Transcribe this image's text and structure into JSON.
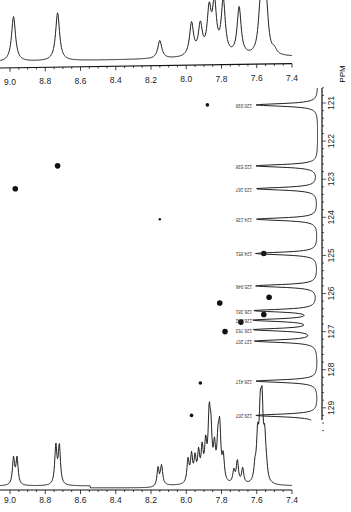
{
  "chart_data": {
    "type": "scatter",
    "title": "",
    "x_axis": {
      "label": "",
      "unit": "ppm (1H)",
      "range": [
        9.0,
        7.4
      ],
      "ticks": [
        "9.0",
        "8.8",
        "8.6",
        "8.4",
        "8.2",
        "8.0",
        "7.8",
        "7.6",
        "7.4"
      ]
    },
    "y_axis": {
      "label": "PPM",
      "unit": "ppm (13C)",
      "range": [
        121,
        129
      ],
      "ticks": [
        "121",
        "122",
        "123",
        "124",
        "125",
        "126",
        "127",
        "128",
        "129"
      ]
    },
    "cross_peaks": [
      {
        "h": 7.88,
        "c": 121.05
      },
      {
        "h": 8.73,
        "c": 122.65
      },
      {
        "h": 8.97,
        "c": 123.25
      },
      {
        "h": 8.15,
        "c": 124.05
      },
      {
        "h": 7.56,
        "c": 124.95
      },
      {
        "h": 7.81,
        "c": 126.25
      },
      {
        "h": 7.53,
        "c": 126.1
      },
      {
        "h": 7.56,
        "c": 126.55
      },
      {
        "h": 7.69,
        "c": 126.75
      },
      {
        "h": 7.78,
        "c": 127.0
      },
      {
        "h": 7.92,
        "c": 128.35
      },
      {
        "h": 7.97,
        "c": 129.2
      }
    ],
    "carbon_peaks": [
      {
        "ppm": 121.05,
        "label": "120.938"
      },
      {
        "ppm": 122.65,
        "label": "122.538"
      },
      {
        "ppm": 123.25,
        "label": "123.167"
      },
      {
        "ppm": 124.05,
        "label": "124.135"
      },
      {
        "ppm": 124.95,
        "label": "124.851"
      },
      {
        "ppm": 125.8,
        "label": "125.946"
      },
      {
        "ppm": 126.45,
        "label": "126.381"
      },
      {
        "ppm": 126.7,
        "label": "126.582"
      },
      {
        "ppm": 126.95,
        "label": "126.763"
      },
      {
        "ppm": 127.25,
        "label": "127.207"
      },
      {
        "ppm": 128.3,
        "label": "128.417"
      },
      {
        "ppm": 129.2,
        "label": "129.207"
      }
    ],
    "top_projection_peaks": [
      {
        "ppm": 8.98,
        "height": 0.75
      },
      {
        "ppm": 8.73,
        "height": 0.8
      },
      {
        "ppm": 8.15,
        "height": 0.3
      },
      {
        "ppm": 7.97,
        "height": 0.55
      },
      {
        "ppm": 7.92,
        "height": 0.5
      },
      {
        "ppm": 7.87,
        "height": 0.72
      },
      {
        "ppm": 7.84,
        "height": 0.82
      },
      {
        "ppm": 7.79,
        "height": 0.9
      },
      {
        "ppm": 7.7,
        "height": 0.8
      },
      {
        "ppm": 7.58,
        "height": 0.68
      },
      {
        "ppm": 7.56,
        "height": 0.72
      },
      {
        "ppm": 7.545,
        "height": 0.6
      },
      {
        "ppm": 7.5,
        "height": 0.08
      }
    ],
    "bottom_projection_peaks": [
      {
        "ppm": 8.98,
        "height": 0.38
      },
      {
        "ppm": 8.96,
        "height": 0.38
      },
      {
        "ppm": 8.74,
        "height": 0.55
      },
      {
        "ppm": 8.72,
        "height": 0.55
      },
      {
        "ppm": 8.16,
        "height": 0.27
      },
      {
        "ppm": 8.14,
        "height": 0.27
      },
      {
        "ppm": 7.99,
        "height": 0.33
      },
      {
        "ppm": 7.97,
        "height": 0.38
      },
      {
        "ppm": 7.95,
        "height": 0.33
      },
      {
        "ppm": 7.93,
        "height": 0.4
      },
      {
        "ppm": 7.91,
        "height": 0.45
      },
      {
        "ppm": 7.89,
        "height": 0.5
      },
      {
        "ppm": 7.87,
        "height": 0.85
      },
      {
        "ppm": 7.86,
        "height": 0.6
      },
      {
        "ppm": 7.84,
        "height": 0.45
      },
      {
        "ppm": 7.82,
        "height": 0.5
      },
      {
        "ppm": 7.81,
        "height": 0.7
      },
      {
        "ppm": 7.79,
        "height": 0.35
      },
      {
        "ppm": 7.73,
        "height": 0.18
      },
      {
        "ppm": 7.71,
        "height": 0.32
      },
      {
        "ppm": 7.68,
        "height": 0.22
      },
      {
        "ppm": 7.61,
        "height": 0.2
      },
      {
        "ppm": 7.595,
        "height": 0.6
      },
      {
        "ppm": 7.58,
        "height": 0.85
      },
      {
        "ppm": 7.57,
        "height": 0.95
      },
      {
        "ppm": 7.555,
        "height": 0.55
      },
      {
        "ppm": 7.545,
        "height": 0.15
      }
    ],
    "grid": false,
    "legend": null
  },
  "labels": {
    "ppm_axis_title": "PPM"
  }
}
